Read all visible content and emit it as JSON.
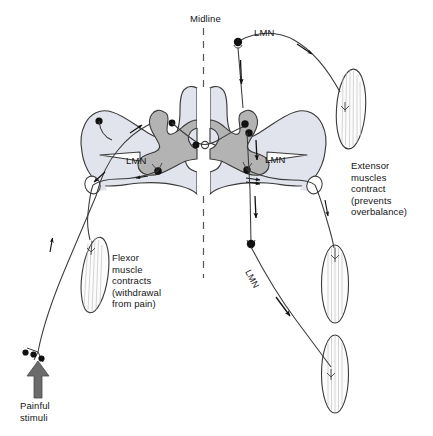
{
  "figure": {
    "labels": {
      "midline": "Midline",
      "lmn_top": "LMN",
      "lmn_left": "LMN",
      "lmn_right": "LMN",
      "lmn_diagonal": "LMN",
      "extensor": "Extensor\nmuscles\ncontract\n(prevents\noverbalance)",
      "flexor": "Flexor\nmuscle\ncontracts\n(withdrawal\nfrom pain)",
      "painful": "Painful\nstimuli"
    },
    "colors": {
      "white_matter": "#e1e4ec",
      "gray_matter": "#b3b3b3",
      "outline": "#3a3a3a",
      "neuron": "#111111",
      "stimulus_arrow": "#6b6b6b",
      "text": "#141414",
      "background": "#ffffff"
    },
    "icon_names": [
      "spinal-cord-cross-section",
      "midline-dashed-line",
      "painful-stimuli-arrow",
      "sensory-receptor-endings",
      "flexor-muscle",
      "extensor-muscle-upper-right",
      "extensor-muscle-middle-right",
      "extensor-muscle-lower-right",
      "neuron-cell-body",
      "direction-arrow"
    ],
    "muscles": [
      {
        "name": "flexor-muscle",
        "position": "left"
      },
      {
        "name": "extensor-muscle-upper-right",
        "position": "upper-right"
      },
      {
        "name": "extensor-muscle-middle-right",
        "position": "middle-right"
      },
      {
        "name": "extensor-muscle-lower-right",
        "position": "lower-right"
      }
    ]
  }
}
